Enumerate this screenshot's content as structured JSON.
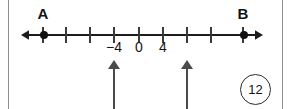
{
  "figure": {
    "problem_number": "12",
    "axis": {
      "left_arrow_icon": "left-arrow-icon",
      "right_arrow_icon": "right-arrow-icon",
      "tick_positions_px": [
        43,
        66,
        90,
        114,
        139,
        163,
        187,
        211,
        243
      ],
      "tick_values": [
        -16,
        -12,
        -8,
        -4,
        0,
        4,
        8,
        12,
        16
      ]
    },
    "points": [
      {
        "label": "A",
        "x_px": 43,
        "value": -16
      },
      {
        "label": "B",
        "x_px": 243,
        "value": 16
      }
    ],
    "number_labels": [
      {
        "text": "−4",
        "x_px": 114
      },
      {
        "text": "0",
        "x_px": 139
      },
      {
        "text": "4",
        "x_px": 163
      }
    ],
    "pointer_arrows": [
      {
        "name": "pointer-arrow-left",
        "x_px": 114,
        "points_to_value": -4
      },
      {
        "name": "pointer-arrow-right",
        "x_px": 187,
        "points_to_value": 8
      }
    ]
  },
  "chart_data": {
    "type": "line",
    "title": "",
    "xlabel": "",
    "ylabel": "",
    "grid": false,
    "legend": null,
    "axis_kind": "number-line",
    "xlim": [
      -18,
      18
    ],
    "tick_values": [
      -16,
      -12,
      -8,
      -4,
      0,
      4,
      8,
      12,
      16
    ],
    "labeled_ticks": [
      "-4",
      "0",
      "4"
    ],
    "marked_points": [
      {
        "name": "A",
        "value": -16
      },
      {
        "name": "B",
        "value": 16
      }
    ],
    "annotations": [
      {
        "type": "up-arrow",
        "at": -4
      },
      {
        "type": "up-arrow",
        "at": 8
      }
    ],
    "problem_number": 12
  }
}
